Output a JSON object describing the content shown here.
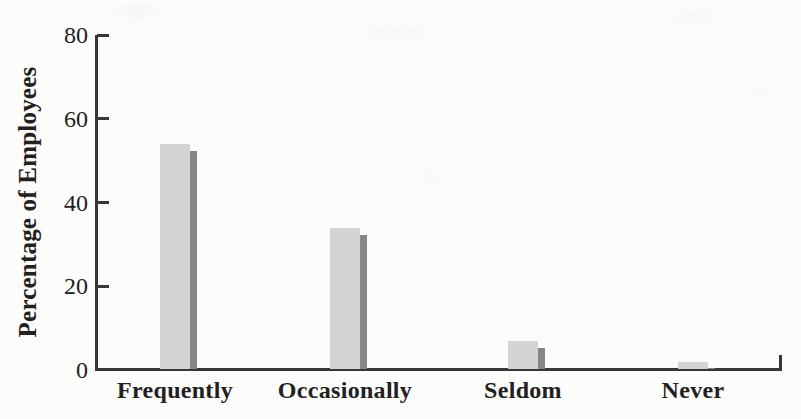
{
  "chart_data": {
    "type": "bar",
    "categories": [
      "Frequently",
      "Occasionally",
      "Seldom",
      "Never"
    ],
    "values": [
      54,
      34,
      7,
      2
    ],
    "title": "",
    "xlabel": "",
    "ylabel": "Percentage of Employees",
    "ylim": [
      0,
      80
    ],
    "yticks": [
      0,
      20,
      40,
      60,
      80
    ],
    "grid": false,
    "legend": "none",
    "bar_style": "flat bars with dark drop-shadow strip offset right and slightly below bar top (pseudo-3D), halftone print texture",
    "colors": {
      "bar_fill": "#d4d4d2",
      "bar_shadow": "#87878b",
      "axis": "#39363a",
      "text": "#232021",
      "background": "#fcfcfb"
    }
  }
}
